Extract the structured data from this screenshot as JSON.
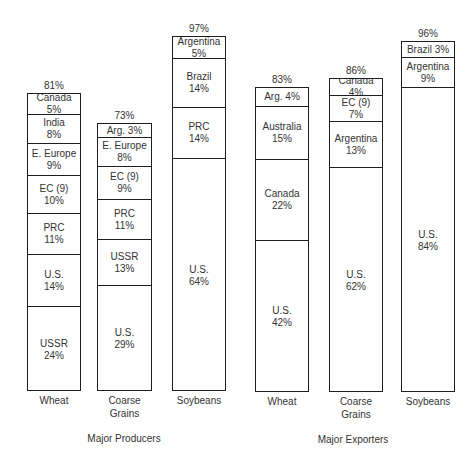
{
  "chart_data": {
    "type": "bar",
    "stacked": true,
    "title": "",
    "xlabel": "",
    "ylabel": "",
    "groups": [
      {
        "label": "Major Producers",
        "bars": [
          {
            "category": "Wheat",
            "total": "81%",
            "segments": [
              {
                "name": "USSR",
                "value": 24
              },
              {
                "name": "U.S.",
                "value": 14
              },
              {
                "name": "PRC",
                "value": 11
              },
              {
                "name": "EC (9)",
                "value": 10
              },
              {
                "name": "E. Europe",
                "value": 9
              },
              {
                "name": "India",
                "value": 8
              },
              {
                "name": "Canada",
                "value": 5,
                "inline": true
              }
            ]
          },
          {
            "category": "Coarse Grains",
            "total": "73%",
            "segments": [
              {
                "name": "U.S.",
                "value": 29
              },
              {
                "name": "USSR",
                "value": 13
              },
              {
                "name": "PRC",
                "value": 11
              },
              {
                "name": "EC (9)",
                "value": 9
              },
              {
                "name": "E. Europe",
                "value": 8
              },
              {
                "name": "Arg.",
                "value": 3,
                "inline": true
              }
            ]
          },
          {
            "category": "Soybeans",
            "total": "97%",
            "segments": [
              {
                "name": "U.S.",
                "value": 64
              },
              {
                "name": "PRC",
                "value": 14
              },
              {
                "name": "Brazil",
                "value": 14
              },
              {
                "name": "Argentina",
                "value": 5
              }
            ]
          }
        ]
      },
      {
        "label": "Major Exporters",
        "bars": [
          {
            "category": "Wheat",
            "total": "83%",
            "segments": [
              {
                "name": "U.S.",
                "value": 42
              },
              {
                "name": "Canada",
                "value": 22
              },
              {
                "name": "Australia",
                "value": 15
              },
              {
                "name": "Arg.",
                "value": 4,
                "inline": true
              }
            ]
          },
          {
            "category": "Coarse Grains",
            "total": "86%",
            "segments": [
              {
                "name": "U.S.",
                "value": 62
              },
              {
                "name": "Argentina",
                "value": 13
              },
              {
                "name": "EC (9)",
                "value": 7
              },
              {
                "name": "Canada",
                "value": 4,
                "inline": true
              }
            ]
          },
          {
            "category": "Soybeans",
            "total": "96%",
            "segments": [
              {
                "name": "U.S.",
                "value": 84
              },
              {
                "name": "Argentina",
                "value": 9
              },
              {
                "name": "Brazil",
                "value": 3,
                "inline": true
              }
            ]
          }
        ]
      }
    ]
  },
  "layout": {
    "bars": [
      {
        "left": 27,
        "width": 54,
        "top": 93,
        "bottom": 391,
        "edges": [
          305,
          253,
          212,
          174,
          142,
          113
        ]
      },
      {
        "left": 97,
        "width": 55,
        "top": 123,
        "bottom": 391,
        "edges": [
          284,
          238,
          198,
          165,
          136
        ]
      },
      {
        "left": 172,
        "width": 54,
        "top": 36,
        "bottom": 391,
        "edges": [
          157,
          106,
          57
        ]
      },
      {
        "left": 255,
        "width": 54,
        "top": 87,
        "bottom": 392,
        "edges": [
          239,
          158,
          105
        ]
      },
      {
        "left": 329,
        "width": 54,
        "top": 78,
        "bottom": 392,
        "edges": [
          166,
          120,
          94
        ]
      },
      {
        "left": 401,
        "width": 54,
        "top": 41,
        "bottom": 392,
        "edges": [
          86,
          56
        ]
      }
    ],
    "groups": [
      {
        "center": 124,
        "top": 433
      },
      {
        "center": 353,
        "top": 434
      }
    ]
  }
}
